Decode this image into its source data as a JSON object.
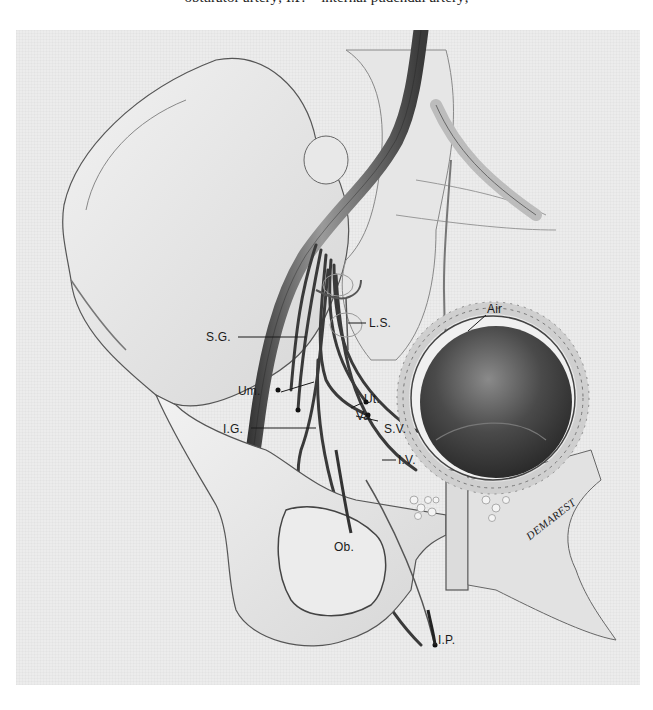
{
  "caption_fragment": "obturator artery; I.P. = internal pudendal artery;",
  "figure": {
    "labels": {
      "sg": "S.G.",
      "ls": "L.S.",
      "air": "Air",
      "um": "Um.",
      "ut": "Ut.",
      "va": "Va",
      "ig": "I.G.",
      "sv": "S.V.",
      "iv": "I.V.",
      "ob": "Ob.",
      "ip": "I.P."
    },
    "signature": "DEMAREST"
  },
  "colors": {
    "background": "#ececec",
    "ink": "#1a1a1a",
    "bladder_dark": "#3a3a3a"
  }
}
